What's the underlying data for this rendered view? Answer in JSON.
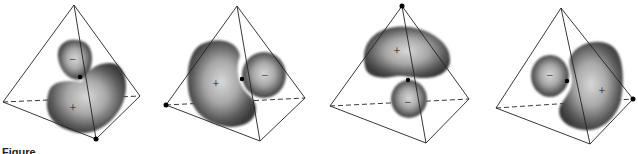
{
  "figure": {
    "caption_partial": "Figure",
    "panels": [
      {
        "id": 1,
        "tetrahedron": {
          "apex": [
            74,
            5
          ],
          "left": [
            3,
            102
          ],
          "right": [
            140,
            96
          ],
          "bottom": [
            96,
            139
          ]
        },
        "marked_vertex": "bottom",
        "nucleus": [
          80,
          77
        ],
        "lobes": [
          {
            "sign": "−",
            "label_pos": [
              73,
              60
            ]
          },
          {
            "sign": "+",
            "label_pos": [
              73,
              109
            ]
          }
        ]
      },
      {
        "id": 2,
        "tetrahedron": {
          "apex": [
            237,
            6
          ],
          "left": [
            166,
            105
          ],
          "right": [
            305,
            98
          ],
          "bottom": [
            260,
            141
          ]
        },
        "marked_vertex": "left",
        "nucleus": [
          242,
          79
        ],
        "lobes": [
          {
            "sign": "+",
            "label_pos": [
              216,
              85
            ]
          },
          {
            "sign": "−",
            "label_pos": [
              265,
              77
            ]
          }
        ]
      },
      {
        "id": 3,
        "tetrahedron": {
          "apex": [
            402,
            6
          ],
          "left": [
            330,
            106
          ],
          "right": [
            469,
            99
          ],
          "bottom": [
            426,
            143
          ]
        },
        "marked_vertex": "apex",
        "nucleus": [
          408,
          80
        ],
        "lobes": [
          {
            "sign": "+",
            "label_pos": [
              397,
              52
            ]
          },
          {
            "sign": "−",
            "label_pos": [
              408,
              103
            ]
          }
        ]
      },
      {
        "id": 4,
        "tetrahedron": {
          "apex": [
            561,
            8
          ],
          "left": [
            496,
            108
          ],
          "right": [
            633,
            99
          ],
          "bottom": [
            590,
            144
          ]
        },
        "marked_vertex": "right",
        "nucleus": [
          567,
          81
        ],
        "lobes": [
          {
            "sign": "−",
            "label_pos": [
              550,
              76
            ]
          },
          {
            "sign": "+",
            "label_pos": [
              602,
              92
            ]
          }
        ]
      }
    ]
  }
}
